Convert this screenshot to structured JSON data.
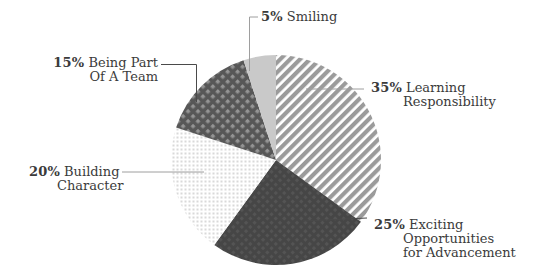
{
  "colors": {
    "background": "#ffffff",
    "label_text": "#3b3b3b",
    "leader_light": "#9e9e9e",
    "leader_dark": "#4a4a4a",
    "stripe_gray": "#9b9b9b",
    "stripe_bg": "#ffffff",
    "dark_slice_bg": "#464646",
    "dark_slice_dot": "#545454",
    "light_grid_bg": "#ffffff",
    "light_grid_dot": "#d9d9d9",
    "crosshatch_bg": "#575757",
    "crosshatch_dot": "#949494",
    "solid_light": "#c9c9c9"
  },
  "chart_data": {
    "type": "pie",
    "start_angle_deg_from_top": 0,
    "direction": "clockwise",
    "slices": [
      {
        "label": "Learning Responsibility",
        "value": 35,
        "pattern": "diagonal-stripes"
      },
      {
        "label": "Exciting Opportunities for Advancement",
        "value": 25,
        "pattern": "dark-dot-texture"
      },
      {
        "label": "Building Character",
        "value": 20,
        "pattern": "light-dot-grid"
      },
      {
        "label": "Being Part Of A Team",
        "value": 15,
        "pattern": "dark-crosshatch"
      },
      {
        "label": "Smiling",
        "value": 5,
        "pattern": "solid-light"
      }
    ]
  },
  "callouts": {
    "smiling": {
      "pct": "5%",
      "line1": "Smiling"
    },
    "learning": {
      "pct": "35%",
      "line1": "Learning",
      "line2": "Responsibility"
    },
    "exciting": {
      "pct": "25%",
      "line1": "Exciting",
      "line2": "Opportunities",
      "line3": "for Advancement"
    },
    "building": {
      "pct": "20%",
      "line1": "Building",
      "line2": "Character"
    },
    "team": {
      "pct": "15%",
      "line1": "Being Part",
      "line2": "Of A Team"
    }
  }
}
